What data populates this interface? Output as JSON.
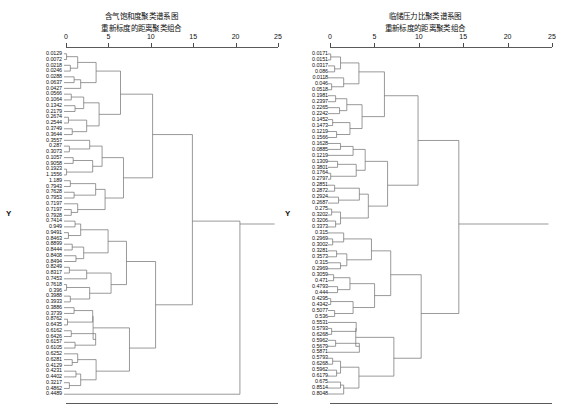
{
  "figure": {
    "background": "#ffffff",
    "line_color": "#6f6f6f",
    "text_color": "#111111"
  },
  "panels": [
    {
      "id": "left",
      "title_line1": "含气饱和度聚类谱系图",
      "title_line2": "重新标度的距离聚类组合",
      "ylabel": "Y",
      "axis": {
        "ticks": [
          "0",
          "5",
          "10",
          "15",
          "20",
          "25"
        ],
        "min": 0,
        "max": 25
      }
    },
    {
      "id": "right",
      "title_line1": "临储压力比聚类谱系图",
      "title_line2": "重新标度的距离聚类组合",
      "ylabel": "Y",
      "axis": {
        "ticks": [
          "0",
          "5",
          "10",
          "15",
          "20",
          "25"
        ],
        "min": 0,
        "max": 25
      }
    }
  ],
  "chart_data": [
    {
      "type": "dendrogram",
      "panel": "left",
      "title": "含气饱和度聚类谱系图",
      "subtitle": "重新标度的距离聚类组合",
      "xlabel": "",
      "ylabel": "Y",
      "xlim": [
        0,
        25
      ],
      "xticks": [
        0,
        5,
        10,
        15,
        20,
        25
      ],
      "grid": false,
      "legend": "none",
      "orientation": "horizontal",
      "leaf_labels": [
        "0.0129",
        "0.0072",
        "0.0218",
        "0.0246",
        "0.0288",
        "0.0637",
        "0.0427",
        "0.0566",
        "0.1064",
        "0.1342",
        "0.2179",
        "0.2674",
        "0.2544",
        "0.3749",
        "0.3644",
        "0.3557",
        "0.287",
        "0.3073",
        "0.1057",
        "0.9058",
        "0.1923",
        "1.1556",
        "1.189",
        "0.7943",
        "0.7628",
        "0.7953",
        "0.7197",
        "0.7197",
        "0.7928",
        "0.7414",
        "0.949",
        "0.9491",
        "0.8463",
        "0.8899",
        "0.8444",
        "0.8408",
        "0.8494",
        "0.8249",
        "0.8317",
        "0.7453",
        "0.7618",
        "0.396",
        "0.3988",
        "0.3933",
        "0.3886",
        "0.3739",
        "0.8762",
        "0.6435",
        "0.6162",
        "0.6426",
        "0.6157",
        "0.6105",
        "0.6252",
        "0.6281",
        "0.4129",
        "0.4231",
        "0.4402",
        "0.3217",
        "0.4862",
        "0.4489"
      ],
      "merges": [
        {
          "left": 0,
          "right": 1,
          "height": 0.6
        },
        {
          "left": 2,
          "right": 3,
          "height": 0.5
        },
        {
          "left": 4,
          "right": 5,
          "height": 0.7
        },
        {
          "left": 6,
          "right": 7,
          "height": 0.6
        },
        {
          "left": 8,
          "right": 9,
          "height": 1.1
        },
        {
          "left": 10,
          "right": 11,
          "height": 1.5
        },
        {
          "left": 12,
          "right": 13,
          "height": 1.4
        },
        {
          "left": 14,
          "right": 15,
          "height": 2.1
        },
        {
          "left": 16,
          "right": 17,
          "height": 1.0
        },
        {
          "left": 18,
          "right": 19,
          "height": 0.9
        },
        {
          "left": 20,
          "right": 21,
          "height": 0.8
        },
        {
          "left": 22,
          "right": 23,
          "height": 1.3
        },
        {
          "cluster": "A",
          "height": 4.6
        },
        {
          "cluster": "B",
          "height": 6.2
        },
        {
          "cluster": "C",
          "height": 9.1
        },
        {
          "cluster": "D",
          "height": 13.4
        },
        {
          "cluster": "root",
          "height": 24.3
        }
      ]
    },
    {
      "type": "dendrogram",
      "panel": "right",
      "title": "临储压力比聚类谱系图",
      "subtitle": "重新标度的距离聚类组合",
      "xlabel": "",
      "ylabel": "Y",
      "xlim": [
        0,
        25
      ],
      "xticks": [
        0,
        5,
        10,
        15,
        20,
        25
      ],
      "grid": false,
      "legend": "none",
      "orientation": "horizontal",
      "leaf_labels": [
        "0.0171",
        "0.0151",
        "0.0317",
        "0.086",
        "0.0118",
        "0.046",
        "0.0518",
        "0.1981",
        "0.2397",
        "0.2265",
        "0.2242",
        "0.1452",
        "0.1473",
        "0.1219",
        "0.1566",
        "0.1628",
        "0.0885",
        "0.1219",
        "0.1309",
        "0.3801",
        "0.1764",
        "0.2797",
        "0.2851",
        "0.2872",
        "0.2924",
        "0.2687",
        "0.275",
        "0.3202",
        "0.3206",
        "0.3373",
        "0.315",
        "0.2969",
        "0.3002",
        "0.3281",
        "0.3573",
        "0.315",
        "0.2969",
        "0.3059",
        "0.471",
        "0.4793",
        "0.444",
        "0.4295",
        "0.4342",
        "0.5077",
        "0.536",
        "0.5531",
        "0.5793",
        "0.6268",
        "0.5962",
        "0.5679",
        "0.5871",
        "0.5793",
        "0.6268",
        "0.5962",
        "0.6179",
        "0.675",
        "0.8514",
        "0.8048"
      ],
      "merges": [
        {
          "left": 0,
          "right": 1,
          "height": 0.5
        },
        {
          "left": 2,
          "right": 3,
          "height": 0.6
        },
        {
          "left": 4,
          "right": 5,
          "height": 1.1
        },
        {
          "left": 6,
          "right": 7,
          "height": 1.3
        },
        {
          "cluster": "A",
          "height": 3.5
        },
        {
          "cluster": "B",
          "height": 5.1
        },
        {
          "cluster": "C",
          "height": 8.6
        },
        {
          "cluster": "D",
          "height": 12.6
        },
        {
          "cluster": "E",
          "height": 16.5
        },
        {
          "cluster": "root",
          "height": 24.1
        }
      ]
    }
  ]
}
